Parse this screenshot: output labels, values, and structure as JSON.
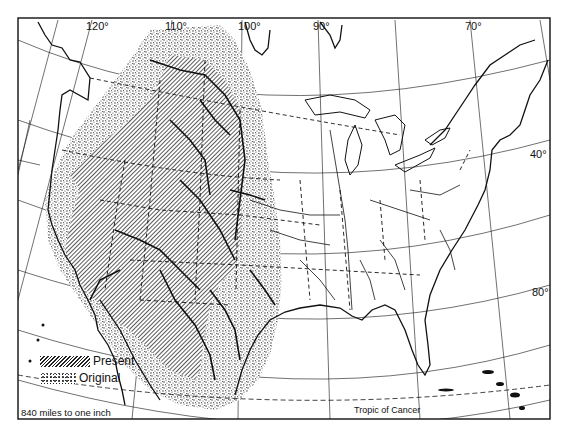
{
  "map": {
    "title": "",
    "frame": {
      "x": 18,
      "y": 18,
      "width": 532,
      "height": 401
    },
    "longitude_labels": [
      {
        "text": "120°",
        "x": 86,
        "y": 20
      },
      {
        "text": "110°",
        "x": 168,
        "y": 20
      },
      {
        "text": "100°",
        "x": 240,
        "y": 20
      },
      {
        "text": "90°",
        "x": 315,
        "y": 20
      },
      {
        "text": "70°",
        "x": 467,
        "y": 20
      }
    ],
    "latitude_labels": [
      {
        "text": "40°",
        "x": 531,
        "y": 148
      },
      {
        "text": "80°",
        "x": 533,
        "y": 287
      }
    ],
    "annotations": {
      "tropic": "Tropic of Cancer",
      "scale": "840 miles to one inch"
    },
    "legend": {
      "items": [
        {
          "label": "Present",
          "pattern": "diagonal-hatch"
        },
        {
          "label": "Original",
          "pattern": "stipple"
        }
      ]
    },
    "colors": {
      "ink": "#111111",
      "paper": "#ffffff",
      "hatch": "#222222",
      "stipple": "#333333"
    }
  }
}
